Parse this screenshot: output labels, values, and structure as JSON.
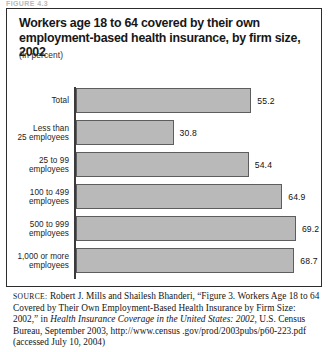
{
  "page": {
    "top_cut_label": "FIGURE 4.3"
  },
  "figure": {
    "title": "Workers age 18 to 64 covered by their own employment-based health insurance, by firm size, 2002",
    "units_note": "(In percent)"
  },
  "chart_data": {
    "type": "bar",
    "orientation": "horizontal",
    "title": "Workers age 18 to 64 covered by their own employment-based health insurance, by firm size, 2002",
    "subtitle": "(In percent)",
    "xlabel": "",
    "ylabel": "",
    "xlim": [
      0,
      72
    ],
    "grid": false,
    "legend": "none",
    "categories": [
      "Total",
      "Less than\n25 employees",
      "25 to 99\nemployees",
      "100 to 499\nemployees",
      "500 to 999\nemployees",
      "1,000 or more\nemployees"
    ],
    "bars": [
      {
        "label_line1": "Total",
        "label_line2": "",
        "value": 55.2,
        "value_label": "55.2"
      },
      {
        "label_line1": "Less than",
        "label_line2": "25 employees",
        "value": 30.8,
        "value_label": "30.8"
      },
      {
        "label_line1": "25 to 99",
        "label_line2": "employees",
        "value": 54.4,
        "value_label": "54.4"
      },
      {
        "label_line1": "100 to 499",
        "label_line2": "employees",
        "value": 64.9,
        "value_label": "64.9"
      },
      {
        "label_line1": "500 to 999",
        "label_line2": "employees",
        "value": 69.2,
        "value_label": "69.2"
      },
      {
        "label_line1": "1,000 or more",
        "label_line2": "employees",
        "value": 68.7,
        "value_label": "68.7"
      }
    ],
    "values": [
      55.2,
      30.8,
      54.4,
      64.9,
      69.2,
      68.7
    ],
    "colors": {
      "bar_fill": "#b9b9b9",
      "bar_stroke": "#5d5d5d",
      "axis": "#3a3a3a",
      "text": "#1d1d1d"
    }
  },
  "source": {
    "label": "SOURCE:",
    "text_part1": " Robert J. Mills and Shailesh Bhanderi, “Figure 3. Workers Age 18 to 64 Covered by Their Own Employment-Based Health Insurance by Firm Size: 2002,” in ",
    "italic1": "Health Insurance Coverage in the United States: 2002,",
    "text_part2": " U.S. Census Bureau, September 2003, http://www.census .gov/prod/2003pubs/p60-223.pdf (accessed July 10, 2004)"
  }
}
